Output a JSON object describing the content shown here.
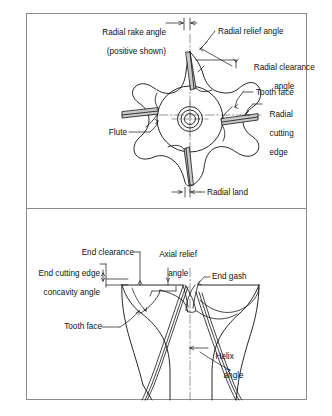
{
  "figure": {
    "panels": [
      {
        "name": "radial-view",
        "description": "End view of a four-flute milling cutter showing radial angles",
        "labels": [
          "Radial rake angle",
          "(positive shown)",
          "Radial relief angle",
          "Radial clearance",
          "angle",
          "Tooth face",
          "Radial",
          "cutting",
          "edge",
          "Flute",
          "Radial land"
        ]
      },
      {
        "name": "axial-view",
        "description": "Side view of an end mill showing axial and end geometry",
        "labels": [
          "End clearance",
          "Axial relief",
          "angle",
          "End cutting edge",
          "concavity angle",
          "End gash",
          "Tooth face",
          "Helix",
          "angle"
        ]
      }
    ]
  },
  "top": {
    "radial_rake_angle_l1": "Radial rake angle",
    "radial_rake_angle_l2": "(positive shown)",
    "radial_relief_angle": "Radial relief angle",
    "radial_clearance_l1": "Radial clearance",
    "radial_clearance_l2": "angle",
    "tooth_face": "Tooth face",
    "radial_cutting_l1": "Radial",
    "radial_cutting_l2": "cutting",
    "radial_cutting_l3": "edge",
    "flute": "Flute",
    "radial_land": "Radial land"
  },
  "bottom": {
    "end_clearance": "End clearance",
    "axial_relief_l1": "Axial relief",
    "axial_relief_l2": "angle",
    "end_cutting_l1": "End cutting edge",
    "end_cutting_l2": "concavity angle",
    "end_gash": "End gash",
    "tooth_face": "Tooth face",
    "helix_l1": "Helix",
    "helix_l2": "angle"
  },
  "colors": {
    "frame": "#8c8c8c",
    "ink": "#111111",
    "land_fill": "#c9c9c9",
    "background": "#ffffff"
  }
}
